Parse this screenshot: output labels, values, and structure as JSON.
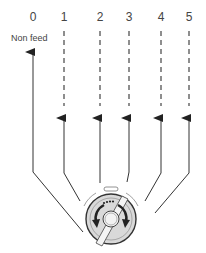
{
  "diagram": {
    "type": "feed-dial-settings",
    "positions": [
      {
        "label": "0",
        "x": 33,
        "dashed": false
      },
      {
        "label": "1",
        "x": 64,
        "dashed": true
      },
      {
        "label": "2",
        "x": 100,
        "dashed": true
      },
      {
        "label": "3",
        "x": 129,
        "dashed": true
      },
      {
        "label": "4",
        "x": 161,
        "dashed": true
      },
      {
        "label": "5",
        "x": 189,
        "dashed": true
      }
    ],
    "non_feed_label": "Non feed",
    "dial": {
      "cx": 111,
      "cy": 219,
      "r": 25
    },
    "colors": {
      "line": "#333333",
      "dial_fill": "#d9d9d9",
      "dial_inner": "#f2f2f2"
    }
  }
}
